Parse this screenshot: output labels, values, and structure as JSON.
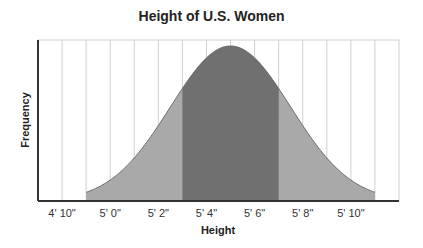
{
  "chart_data": {
    "type": "area",
    "title": "Height of U.S. Women",
    "xlabel": "Height",
    "ylabel": "Frequency",
    "x_unit": "inches",
    "xlim": [
      57,
      72
    ],
    "tick_labels": [
      "4' 10\"",
      "5' 0\"",
      "5' 2\"",
      "5' 4\"",
      "5' 6\"",
      "5' 8\"",
      "5' 10\""
    ],
    "tick_values_inches": [
      58,
      60,
      62,
      64,
      66,
      68,
      70
    ],
    "distribution": {
      "kind": "normal",
      "mean_inches": 65,
      "sd_inches": 2.5
    },
    "shaded_regions": [
      {
        "from_inches": 59,
        "to_inches": 71,
        "color": "#a8a8a8",
        "label": "outer"
      },
      {
        "from_inches": 63,
        "to_inches": 67,
        "color": "#6e6e6e",
        "label": "central"
      }
    ],
    "grid": {
      "vertical": true,
      "step_inches": 1,
      "horizontal": false
    },
    "legend": null,
    "y_ticks": []
  },
  "colors": {
    "curve_line": "#6a6a6a",
    "outer_fill": "#a9a9a9",
    "inner_fill": "#707070",
    "grid": "#cfcfcf",
    "axis": "#333333"
  }
}
